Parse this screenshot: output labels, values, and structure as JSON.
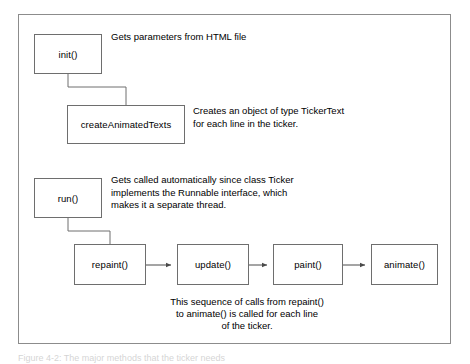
{
  "figure": {
    "caption": "Figure 4-2: The major methods that the ticker needs"
  },
  "diagram": {
    "colors": {
      "box_border": "#6e6e6e",
      "frame_border": "#8c8c8c",
      "background": "#ffffff",
      "text": "#000000",
      "connector": "#6e6e6e"
    },
    "nodes": [
      {
        "id": "init",
        "label": "init()"
      },
      {
        "id": "create",
        "label": "createAnimatedTexts"
      },
      {
        "id": "run",
        "label": "run()"
      },
      {
        "id": "repaint",
        "label": "repaint()"
      },
      {
        "id": "update",
        "label": "update()"
      },
      {
        "id": "paint",
        "label": "paint()"
      },
      {
        "id": "animate",
        "label": "animate()"
      }
    ],
    "descriptions": {
      "init": "Gets parameters from HTML file",
      "create": "Creates an object of type TickerText\nfor each line in the ticker.",
      "run": "Gets called automatically since class Ticker\nimplements the Runnable interface, which\nmakes it a separate thread.",
      "sequence": "This sequence of calls from repaint()\nto animate() is called for each line\nof the ticker."
    }
  }
}
